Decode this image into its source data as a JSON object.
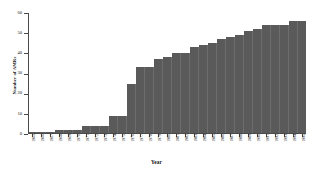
{
  "chart_data": {
    "type": "bar",
    "title": "",
    "xlabel": "Year",
    "ylabel": "Number of AMRs",
    "ylim": [
      0,
      60
    ],
    "yticks": [
      0,
      10,
      20,
      30,
      40,
      50,
      60
    ],
    "grid": false,
    "legend": "none",
    "bar_color": "#5a5a5a",
    "axis_color": "#4a4a4a",
    "background": "#ffffff",
    "categories": [
      "1965",
      "1966",
      "1967",
      "1968",
      "1969",
      "1970",
      "1971",
      "1972",
      "1973",
      "1974",
      "1975",
      "1976",
      "1977",
      "1978",
      "1979",
      "1980",
      "1981",
      "1982",
      "1983",
      "1984",
      "1985",
      "1986",
      "1987",
      "1988",
      "1989",
      "1990",
      "1991",
      "1992",
      "1993",
      "1994",
      "1995"
    ],
    "values": [
      1,
      1,
      1,
      2,
      2,
      2,
      4,
      4,
      4,
      9,
      9,
      25,
      33,
      33,
      37,
      38,
      40,
      40,
      43,
      44,
      45,
      47,
      48,
      49,
      51,
      52,
      54,
      54,
      54,
      56,
      56
    ]
  },
  "axis": {
    "x_title": "Year",
    "y_title": "Number of AMRs",
    "y_tick_labels": [
      "60",
      "50",
      "40",
      "30",
      "20",
      "10",
      "0"
    ]
  }
}
